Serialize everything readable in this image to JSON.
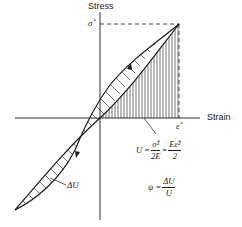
{
  "axes": {
    "y_label": "Stress",
    "x_label": "Strain",
    "y_peak_label": "σ̂",
    "x_peak_label": "ε̂"
  },
  "annotations": {
    "loss_area_label": "ΔU",
    "energy_eq": {
      "lhs": "U =",
      "frac1_num": "σ̂²",
      "frac1_den": "2E",
      "equals": "=",
      "frac2_num": "Eε̂²",
      "frac2_den": "2"
    },
    "loss_factor_eq": {
      "lhs": "ψ =",
      "num": "ΔU",
      "den": "U"
    }
  },
  "colors": {
    "ink": "#1a1a1a",
    "background": "#ffffff"
  }
}
